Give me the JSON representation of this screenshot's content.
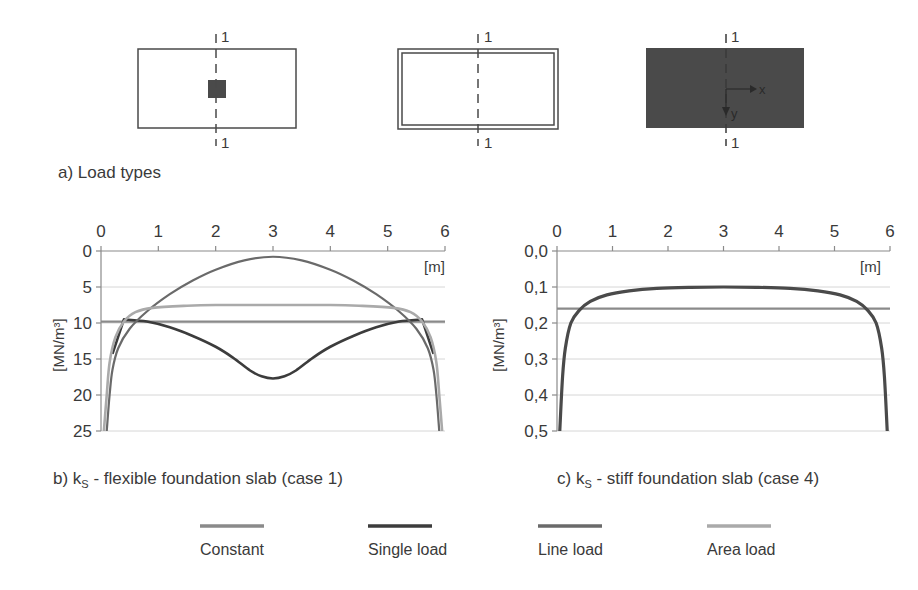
{
  "figure": {
    "panel_a": {
      "caption": "a) Load types",
      "diagrams": [
        {
          "type": "single-load",
          "section_label_top": "1",
          "section_label_bottom": "1"
        },
        {
          "type": "line-load",
          "section_label_top": "1",
          "section_label_bottom": "1"
        },
        {
          "type": "area-load",
          "section_label_top": "1",
          "section_label_bottom": "1",
          "axis_x": "x",
          "axis_y": "y"
        }
      ]
    },
    "panel_b": {
      "caption_prefix": "b) k",
      "caption_sub": "S",
      "caption_suffix": " - flexible foundation slab (case 1)"
    },
    "panel_c": {
      "caption_prefix": "c) k",
      "caption_sub": "S",
      "caption_suffix": " - stiff foundation slab (case 4)"
    },
    "legend": [
      {
        "label": "Constant",
        "color": "#8a8a8a"
      },
      {
        "label": "Single load",
        "color": "#3c3c3c"
      },
      {
        "label": "Line load",
        "color": "#6a6a6a"
      },
      {
        "label": "Area load",
        "color": "#aaaaaa"
      }
    ]
  },
  "chart_data": [
    {
      "type": "line",
      "title": "b) kS - flexible foundation slab (case 1)",
      "xlabel": "[m]",
      "ylabel": "[MN/m³]",
      "xlim": [
        0,
        6
      ],
      "ylim": [
        0,
        25
      ],
      "y_inverted": true,
      "x_axis_position": "top",
      "xticks": [
        "0",
        "1",
        "2",
        "3",
        "4",
        "5",
        "6"
      ],
      "yticks": [
        "0",
        "5",
        "10",
        "15",
        "20",
        "25"
      ],
      "grid": "horizontal",
      "series": [
        {
          "name": "Constant",
          "color": "#8a8a8a",
          "x": [
            0.0,
            6.0
          ],
          "y": [
            9.8,
            9.8
          ]
        },
        {
          "name": "Single load",
          "color": "#3c3c3c",
          "x": [
            0.2,
            0.4,
            0.8,
            1.2,
            1.6,
            2.0,
            2.3,
            2.6,
            2.8,
            3.0,
            3.2,
            3.4,
            3.7,
            4.0,
            4.4,
            4.8,
            5.2,
            5.6,
            5.8
          ],
          "y": [
            14.3,
            9.5,
            9.8,
            10.6,
            11.8,
            13.3,
            14.8,
            16.6,
            17.4,
            17.7,
            17.4,
            16.6,
            14.8,
            13.3,
            11.8,
            10.6,
            9.8,
            9.5,
            14.3
          ]
        },
        {
          "name": "Line load",
          "color": "#6a6a6a",
          "x": [
            0.1,
            0.15,
            0.2,
            0.3,
            0.5,
            0.8,
            1.2,
            1.6,
            2.0,
            2.5,
            3.0,
            3.5,
            4.0,
            4.4,
            4.8,
            5.2,
            5.5,
            5.7,
            5.8,
            5.85,
            5.9
          ],
          "y": [
            25,
            20,
            16.5,
            13.5,
            10.8,
            8.4,
            6.0,
            4.1,
            2.6,
            1.3,
            0.8,
            1.3,
            2.6,
            4.1,
            6.0,
            8.4,
            10.8,
            13.5,
            16.5,
            20,
            25
          ]
        },
        {
          "name": "Area load",
          "color": "#aaaaaa",
          "x": [
            0.05,
            0.1,
            0.15,
            0.25,
            0.4,
            0.6,
            0.9,
            1.5,
            2.0,
            3.0,
            4.0,
            4.5,
            5.1,
            5.4,
            5.6,
            5.75,
            5.85,
            5.9,
            5.95
          ],
          "y": [
            25,
            20,
            15.5,
            12.0,
            9.8,
            8.5,
            7.9,
            7.6,
            7.5,
            7.5,
            7.5,
            7.6,
            7.9,
            8.5,
            9.8,
            12.0,
            15.5,
            20,
            25
          ]
        }
      ]
    },
    {
      "type": "line",
      "title": "c) kS - stiff foundation slab (case 4)",
      "xlabel": "[m]",
      "ylabel": "[MN/m³]",
      "xlim": [
        0,
        6
      ],
      "ylim": [
        0.0,
        0.5
      ],
      "y_inverted": true,
      "x_axis_position": "top",
      "xticks": [
        "0",
        "1",
        "2",
        "3",
        "4",
        "5",
        "6"
      ],
      "yticks": [
        "0,0",
        "0,1",
        "0,2",
        "0,3",
        "0,4",
        "0,5"
      ],
      "grid": "horizontal",
      "series": [
        {
          "name": "Constant",
          "color": "#8a8a8a",
          "x": [
            0.0,
            6.0
          ],
          "y": [
            0.16,
            0.16
          ]
        },
        {
          "name": "Single load / Line load / Area load (coincident)",
          "color": "#4a4a4a",
          "x": [
            0.05,
            0.1,
            0.15,
            0.25,
            0.4,
            0.6,
            0.9,
            1.3,
            1.8,
            2.4,
            3.0,
            3.6,
            4.2,
            4.7,
            5.1,
            5.4,
            5.6,
            5.75,
            5.85,
            5.9,
            5.95
          ],
          "y": [
            0.5,
            0.35,
            0.27,
            0.2,
            0.165,
            0.14,
            0.122,
            0.111,
            0.104,
            0.101,
            0.1,
            0.101,
            0.104,
            0.111,
            0.122,
            0.14,
            0.165,
            0.2,
            0.27,
            0.35,
            0.5
          ]
        }
      ]
    }
  ]
}
